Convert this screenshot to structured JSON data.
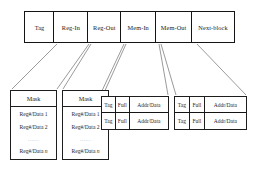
{
  "diagram": {
    "top_row": {
      "name": "block-fields",
      "cells": [
        {
          "label": "Tag",
          "key": "tag"
        },
        {
          "label": "Reg-In",
          "key": "reg-in"
        },
        {
          "label": "Reg-Out",
          "key": "reg-out"
        },
        {
          "label": "Mem-In",
          "key": "mem-in"
        },
        {
          "label": "Mem-Out",
          "key": "mem-out"
        },
        {
          "label": "Next-block",
          "key": "next-block"
        }
      ]
    },
    "mask_boxes": [
      {
        "name": "reg-in-detail",
        "header": "Mask",
        "rows": [
          {
            "text": "Reg#/Data 1",
            "italic_suffix": ""
          },
          {
            "text": "Reg#/Data 2",
            "italic_suffix": ""
          },
          {
            "text": "......",
            "italic_suffix": ""
          },
          {
            "text": "Reg#/Data ",
            "italic_suffix": "n"
          }
        ]
      },
      {
        "name": "reg-out-detail",
        "header": "Mask",
        "rows": [
          {
            "text": "Reg#/Data 1",
            "italic_suffix": ""
          },
          {
            "text": "Reg#/Data 2",
            "italic_suffix": ""
          },
          {
            "text": "......",
            "italic_suffix": ""
          },
          {
            "text": "Reg#/Data ",
            "italic_suffix": "n"
          }
        ]
      }
    ],
    "mem_tables": [
      {
        "name": "mem-in-detail",
        "columns": [
          "Tag",
          "Full",
          "Addr/Data"
        ],
        "rows": [
          [
            "Tag",
            "Full",
            "Addr/Data"
          ],
          [
            "Tag",
            "Full",
            "Addr/Data"
          ]
        ]
      },
      {
        "name": "mem-out-detail",
        "columns": [
          "Tag",
          "Full",
          "Addr/Data"
        ],
        "rows": [
          [
            "Tag",
            "Full",
            "Addr/Data"
          ],
          [
            "Tag",
            "Full",
            "Addr/Data"
          ]
        ]
      }
    ],
    "colors": {
      "background": "#ffffff",
      "border": "#141414",
      "thin_border": "#1d1d1d",
      "connector": "#6f6f6f",
      "text": "#1a1a1a",
      "muted_text": "#8d8d8d"
    }
  }
}
